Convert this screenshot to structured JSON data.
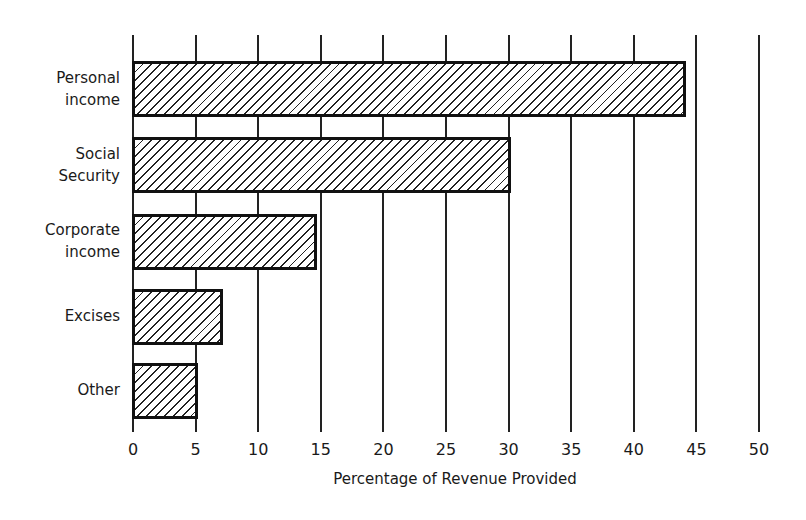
{
  "chart_data": {
    "type": "bar",
    "orientation": "horizontal",
    "title": "",
    "categories": [
      "Personal income",
      "Social Security",
      "Corporate income",
      "Excises",
      "Other"
    ],
    "values": [
      44,
      30,
      14.5,
      7,
      5
    ],
    "xlabel": "Percentage of Revenue Provided",
    "ylabel": "",
    "xlim": [
      0,
      50
    ],
    "xticks": [
      0,
      5,
      10,
      15,
      20,
      25,
      30,
      35,
      40,
      45,
      50
    ],
    "grid": true,
    "legend": null,
    "fill": "diagonal-hatch"
  },
  "labels": {
    "cat0": "Personal\nincome",
    "cat1": "Social\nSecurity",
    "cat2": "Corporate\nincome",
    "cat3": "Excises",
    "cat4": "Other",
    "ticks": [
      "0",
      "5",
      "10",
      "15",
      "20",
      "25",
      "30",
      "35",
      "40",
      "45",
      "50"
    ],
    "xlabel": "Percentage of Revenue Provided"
  }
}
